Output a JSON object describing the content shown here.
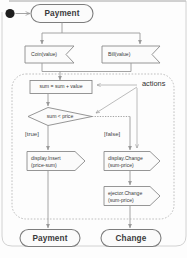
{
  "diagram": {
    "type": "uml-activity-diagram",
    "initial_state": {
      "name": "initial-state",
      "shape": "filled-circle"
    },
    "states": [
      {
        "id": "payment_top",
        "label": "Payment",
        "shape": "rounded-rectangle",
        "position": "top"
      },
      {
        "id": "payment_bottom",
        "label": "Payment",
        "shape": "rounded-rectangle",
        "position": "bottom-left"
      },
      {
        "id": "change_bottom",
        "label": "Change",
        "shape": "rounded-rectangle",
        "position": "bottom-right"
      }
    ],
    "signal_receipts": [
      {
        "id": "coin",
        "label": "Coin(value)",
        "shape": "signal-receipt"
      },
      {
        "id": "bill",
        "label": "Bill(value)",
        "shape": "signal-receipt"
      }
    ],
    "action_box": {
      "id": "sum_assign",
      "label": "sum = sum + value",
      "shape": "rectangle"
    },
    "decision": {
      "id": "sum_lt_price",
      "label": "sum < price",
      "shape": "diamond"
    },
    "guards": [
      {
        "id": "guard_true",
        "label": "[true]"
      },
      {
        "id": "guard_false",
        "label": "[false]"
      }
    ],
    "signal_sends": [
      {
        "id": "display_insert",
        "line1": "display.Insert",
        "line2": "(price-sum)",
        "shape": "signal-send"
      },
      {
        "id": "display_change",
        "line1": "display.Change",
        "line2": "(sum-price)",
        "shape": "signal-send"
      },
      {
        "id": "ejector_change",
        "line1": "ejector.Change",
        "line2": "(sum-price)",
        "shape": "signal-send"
      }
    ],
    "annotation": {
      "id": "actions_note",
      "label": "actions",
      "leader_count": 3
    },
    "region": {
      "id": "activity-region",
      "style": "dashed-rounded-rectangle"
    },
    "colors": {
      "background": "#fdfdfd",
      "shape_fill": "#fbfbfb",
      "shape_stroke": "#8a8a8a",
      "flow_stroke": "#9a9a9a",
      "dashed_stroke": "#b4b4b4",
      "text": "#3a3a3a",
      "initial_dot": "#1e1e1e"
    }
  }
}
